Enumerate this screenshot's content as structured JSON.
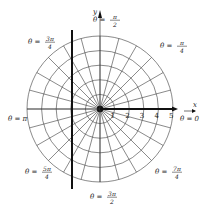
{
  "figure": {
    "type": "polar-coordinate-grid",
    "center": {
      "x": 100,
      "y": 109
    },
    "unit_px": 14.6,
    "circles": [
      1,
      2,
      3,
      4,
      5
    ],
    "radial_step_deg": 15,
    "colors": {
      "grid": "#3a3a3a",
      "heavy": "#111111",
      "background": "#ffffff"
    },
    "axes": {
      "x_label": "x",
      "y_label": "y"
    },
    "radius_ticks": [
      "1",
      "2",
      "3",
      "4",
      "5"
    ],
    "angle_labels": [
      {
        "id": "theta-0",
        "prefix": "θ = ",
        "value": "0",
        "frac": false,
        "x": 180,
        "y": 121
      },
      {
        "id": "theta-pi-4",
        "prefix": "θ = ",
        "num": "π",
        "den": "4",
        "frac": true,
        "x": 160,
        "y": 48
      },
      {
        "id": "theta-pi-2",
        "prefix": "θ = ",
        "num": "π",
        "den": "2",
        "frac": true,
        "x": 93,
        "y": 22
      },
      {
        "id": "theta-3pi-4",
        "prefix": "θ = ",
        "num": "3π",
        "den": "4",
        "frac": true,
        "x": 28,
        "y": 44
      },
      {
        "id": "theta-pi",
        "prefix": "θ = ",
        "value": "π",
        "frac": false,
        "x": 8,
        "y": 121
      },
      {
        "id": "theta-5pi-4",
        "prefix": "θ = ",
        "num": "5π",
        "den": "4",
        "frac": true,
        "x": 25,
        "y": 174
      },
      {
        "id": "theta-7pi-4",
        "prefix": "θ = ",
        "num": "7π",
        "den": "4",
        "frac": true,
        "x": 155,
        "y": 174
      },
      {
        "id": "theta-3pi-2",
        "prefix": "θ = ",
        "num": "3π",
        "den": "2",
        "frac": true,
        "x": 90,
        "y": 199
      }
    ],
    "heavy_vertical_line": {
      "x": 72,
      "y1": 30,
      "y2": 189
    },
    "heavy_ray": {
      "angle": "0",
      "from_r": 0,
      "to_x": 178
    }
  }
}
